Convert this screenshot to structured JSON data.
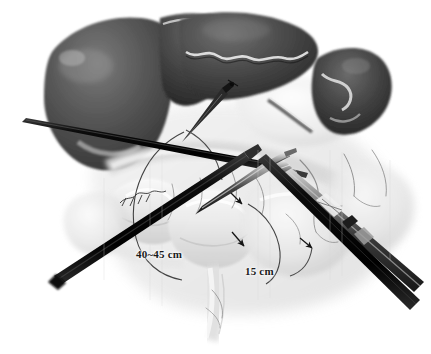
{
  "figure": {
    "background_color": "#ffffff",
    "width": 431,
    "height": 354,
    "style": "grayscale medical illustration"
  },
  "annotations": {
    "bowel_length": {
      "text": "40~45 cm",
      "color": "#1a1a1a"
    },
    "limb_length": {
      "text": "15 cm",
      "color": "#1a1a1a"
    }
  },
  "anatomy": [
    {
      "name": "liver-left-lobe",
      "tone": "#4a4a4a"
    },
    {
      "name": "liver-right-lobe",
      "tone": "#3d3d3d"
    },
    {
      "name": "spleen",
      "tone": "#454545"
    },
    {
      "name": "stomach",
      "tone": "#d8d8d8"
    },
    {
      "name": "small-bowel-loops",
      "tone": "#e2e2e2"
    },
    {
      "name": "mesentery",
      "tone": "#ededed"
    },
    {
      "name": "mesenteric-vessels",
      "tone": "#8d8d8d"
    }
  ],
  "instruments": [
    {
      "name": "grasper-upper-left",
      "tone": "#121212"
    },
    {
      "name": "grasper-lower-left",
      "tone": "#141414"
    },
    {
      "name": "grasper-center",
      "tone": "#2b2b2b"
    },
    {
      "name": "grasper-lower-right",
      "tone": "#161616"
    }
  ],
  "measurement_markers": [
    {
      "name": "arc-bowel-length"
    },
    {
      "name": "arc-limb-length"
    },
    {
      "name": "arrow-proximal"
    },
    {
      "name": "arrow-distal"
    }
  ],
  "icons": {
    "arrowhead": "arrowhead-icon",
    "suture_mark": "suture-mark-icon"
  }
}
